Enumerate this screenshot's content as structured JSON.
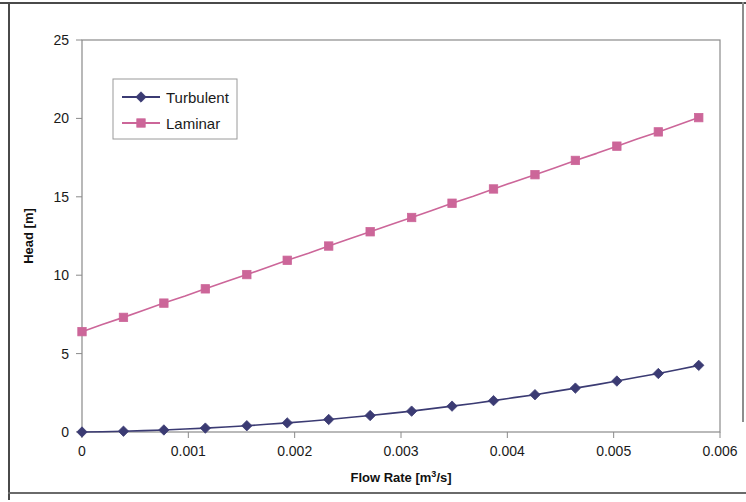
{
  "chart_data": {
    "type": "line",
    "title": "",
    "xlabel": "Flow Rate [m3/s]",
    "xlabel_base": "Flow Rate [m",
    "xlabel_sup": "3",
    "xlabel_tail": "/s]",
    "ylabel": "Head [m]",
    "xlim": [
      0,
      0.006
    ],
    "ylim": [
      0,
      25
    ],
    "xticks": [
      0,
      0.001,
      0.002,
      0.003,
      0.004,
      0.005,
      0.006
    ],
    "xtick_labels": [
      "0",
      "0.001",
      "0.002",
      "0.003",
      "0.004",
      "0.005",
      "0.006"
    ],
    "yticks": [
      0,
      5,
      10,
      15,
      20,
      25
    ],
    "ytick_labels": [
      "0",
      "5",
      "10",
      "15",
      "20",
      "25"
    ],
    "grid": false,
    "legend_position": "upper-left-inside",
    "x": [
      0.0,
      0.00019,
      0.00039,
      0.00058,
      0.00077,
      0.00097,
      0.00116,
      0.00135,
      0.00155,
      0.00174,
      0.00193,
      0.00213,
      0.00232,
      0.00251,
      0.00271,
      0.0029,
      0.0031,
      0.00329,
      0.00348,
      0.00368,
      0.00387,
      0.00406,
      0.00426,
      0.00445,
      0.00464,
      0.00484,
      0.00503,
      0.00522,
      0.00542,
      0.00561,
      0.0058
    ],
    "series": [
      {
        "name": "Turbulent",
        "color": "#3b3b73",
        "marker": "diamond",
        "values": [
          0.0,
          0.02,
          0.05,
          0.09,
          0.13,
          0.19,
          0.25,
          0.32,
          0.4,
          0.49,
          0.58,
          0.69,
          0.8,
          0.92,
          1.05,
          1.19,
          1.33,
          1.49,
          1.65,
          1.82,
          2.0,
          2.19,
          2.38,
          2.59,
          2.8,
          3.02,
          3.25,
          3.49,
          3.73,
          3.99,
          4.25
        ],
        "marker_x": [
          0.0,
          0.00039,
          0.00077,
          0.00116,
          0.00155,
          0.00193,
          0.00232,
          0.00271,
          0.0031,
          0.00348,
          0.00387,
          0.00426,
          0.00464,
          0.00503,
          0.00542,
          0.0058
        ],
        "marker_values": [
          0.0,
          0.05,
          0.13,
          0.25,
          0.4,
          0.58,
          0.8,
          1.05,
          1.33,
          1.65,
          2.0,
          2.38,
          2.8,
          3.25,
          3.73,
          4.25
        ]
      },
      {
        "name": "Laminar",
        "color": "#cc6699",
        "marker": "square",
        "values": [
          6.4,
          6.85,
          7.31,
          7.76,
          8.22,
          8.67,
          9.13,
          9.58,
          10.04,
          10.49,
          10.95,
          11.4,
          11.86,
          12.31,
          12.77,
          13.22,
          13.68,
          14.13,
          14.59,
          15.04,
          15.5,
          15.95,
          16.41,
          16.86,
          17.32,
          17.77,
          18.23,
          18.68,
          19.14,
          19.59,
          20.05
        ],
        "marker_x": [
          0.0,
          0.00039,
          0.00077,
          0.00116,
          0.00155,
          0.00193,
          0.00232,
          0.00271,
          0.0031,
          0.00348,
          0.00387,
          0.00426,
          0.00464,
          0.00503,
          0.00542,
          0.0058
        ],
        "marker_values": [
          6.4,
          7.31,
          8.22,
          9.13,
          10.04,
          10.95,
          11.86,
          12.77,
          13.68,
          14.59,
          15.5,
          16.41,
          17.32,
          18.23,
          19.14,
          20.05
        ]
      }
    ]
  },
  "legend": {
    "entries": [
      {
        "label": "Turbulent"
      },
      {
        "label": "Laminar"
      }
    ]
  },
  "axes": {
    "x_title": "Flow Rate [m3/s]",
    "y_title": "Head [m]"
  },
  "colors": {
    "turbulent": "#3b3b73",
    "laminar": "#cc6699",
    "axis": "#7d7d7d",
    "text": "#1a1a1a",
    "plot_background": "#ffffff"
  }
}
